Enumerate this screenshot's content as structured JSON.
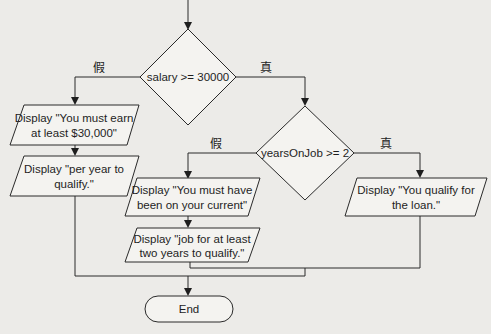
{
  "diagram": {
    "type": "flowchart",
    "decisions": [
      {
        "id": "d1",
        "text": "salary >= 30000",
        "false_label": "假",
        "true_label": "真"
      },
      {
        "id": "d2",
        "text": "yearsOnJob >= 2",
        "false_label": "假",
        "true_label": "真"
      }
    ],
    "outputs": [
      {
        "id": "o1",
        "lines": [
          "Display \"You must earn",
          "at least $30,000\""
        ]
      },
      {
        "id": "o2",
        "lines": [
          "Display \"per year to",
          "qualify.\""
        ]
      },
      {
        "id": "o3",
        "lines": [
          "Display \"You must have",
          "been on your current\""
        ]
      },
      {
        "id": "o4",
        "lines": [
          "Display \"job for at least",
          "two years to qualify.\""
        ]
      },
      {
        "id": "o5",
        "lines": [
          "Display \"You qualify for",
          "the loan.\""
        ]
      }
    ],
    "terminal": {
      "text": "End"
    }
  }
}
